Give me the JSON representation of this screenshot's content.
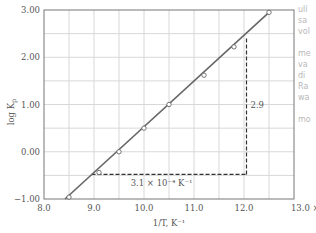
{
  "chart_data": {
    "type": "scatter",
    "title": "",
    "xlabel": "1/T, K⁻¹",
    "ylabel": "log Kp",
    "x_ticks": [
      "8.0",
      "9.0",
      "10.0",
      "11.0",
      "12.0",
      "13.0 × 10⁻⁴"
    ],
    "y_ticks": [
      "3.00",
      "2.00",
      "1.00",
      "0.00",
      "−1.00"
    ],
    "xlim": [
      8.0,
      13.0
    ],
    "ylim": [
      -1.0,
      3.0
    ],
    "grid": true,
    "x_scale_note": "× 10⁻⁴",
    "series": [
      {
        "name": "data points",
        "marker": "open-circle",
        "x": [
          8.5,
          9.1,
          9.5,
          10.0,
          10.5,
          11.2,
          11.8,
          12.5
        ],
        "y": [
          -0.96,
          -0.44,
          0.0,
          0.5,
          1.0,
          1.62,
          2.22,
          2.95
        ]
      },
      {
        "name": "fit line",
        "type": "line",
        "x": [
          8.42,
          12.5
        ],
        "y": [
          -1.0,
          2.95
        ]
      }
    ],
    "annotations": [
      {
        "text": "3.1 × 10⁻⁴ K⁻¹",
        "type": "run",
        "from_x": 8.95,
        "to_x": 12.05,
        "at_y": -0.48
      },
      {
        "text": "2.9",
        "type": "rise",
        "at_x": 12.05,
        "from_y": -0.48,
        "to_y": 2.4
      }
    ]
  },
  "labels": {
    "xlabel": "1/T, K⁻¹",
    "ylabel_main": "log K",
    "ylabel_sub": "p",
    "run": "3.1 × 10⁻⁴ K⁻¹",
    "rise": "2.9",
    "x_ticks": [
      "8.0",
      "9.0",
      "10.0",
      "11.0",
      "12.0",
      "13.0 × 10⁻⁴"
    ],
    "y_ticks": [
      "3.00",
      "2.00",
      "1.00",
      "0.00",
      "−1.00"
    ]
  },
  "margin_notes": "ulí\nsa\nvol\n\nme\nva\ndi\nRa\nwa\n\nmo"
}
